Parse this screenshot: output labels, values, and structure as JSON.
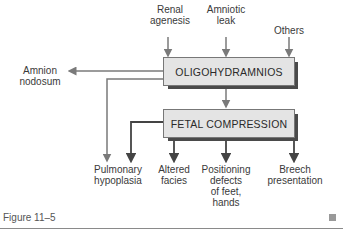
{
  "diagram": {
    "inputs": [
      {
        "label": "Renal\nagenesis",
        "line1": "Renal",
        "line2": "agenesis"
      },
      {
        "label": "Amniotic\nleak",
        "line1": "Amniotic",
        "line2": "leak"
      },
      {
        "label": "Others",
        "line1": "Others"
      }
    ],
    "main_box": {
      "label": "OLIGOHYDRAMNIOS"
    },
    "side_output": {
      "line1": "Amnion",
      "line2": "nodosum"
    },
    "secondary_box": {
      "label": "FETAL COMPRESSION"
    },
    "outputs": [
      {
        "lines": [
          "Pulmonary",
          "hypoplasia"
        ]
      },
      {
        "lines": [
          "Altered",
          "facies"
        ]
      },
      {
        "lines": [
          "Positioning",
          "defects",
          "of feet,",
          "hands"
        ]
      },
      {
        "lines": [
          "Breech",
          "presentation"
        ]
      }
    ],
    "colors": {
      "box_fill": "#e4e4e4",
      "shadow": "#4a4a4a",
      "gray_arrow": "#7a7a7a",
      "dark_arrow": "#444444"
    }
  },
  "caption": {
    "label": "Figure 11–5"
  }
}
